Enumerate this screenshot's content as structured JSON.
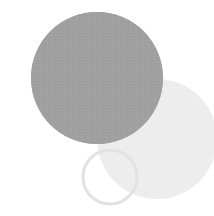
{
  "canvas": {
    "width": 214,
    "height": 216,
    "background_color": "#ffffff",
    "description": "abstract overlapping circles graphic"
  },
  "palette": {
    "main_circle_fill": "#a0a0a0",
    "main_circle_texture_line": "#9a9a9a",
    "secondary_circle_fill": "#ededed",
    "ring_stroke": "#e2e2e2",
    "background": "#ffffff"
  },
  "shapes": [
    {
      "id": "secondary-circle",
      "kind": "circle",
      "role": "background-disc",
      "cx": 157,
      "cy": 139,
      "r": 60,
      "fill": "#ededed",
      "stroke": "none",
      "stroke_width": 0,
      "z": 1,
      "label": "Light gray disc"
    },
    {
      "id": "main-circle",
      "kind": "circle",
      "role": "foreground-disc",
      "cx": 97,
      "cy": 78,
      "r": 66,
      "fill": "#a0a0a0",
      "stroke": "none",
      "stroke_width": 0,
      "z": 2,
      "texture": "horizontal-hairlines",
      "label": "Medium gray textured disc"
    },
    {
      "id": "outline-ring",
      "kind": "ring",
      "role": "outline-circle",
      "cx": 110,
      "cy": 177,
      "r": 27,
      "fill": "none",
      "stroke": "#e2e2e2",
      "stroke_width": 3,
      "z": 3,
      "label": "Thin gray outlined ring"
    }
  ]
}
